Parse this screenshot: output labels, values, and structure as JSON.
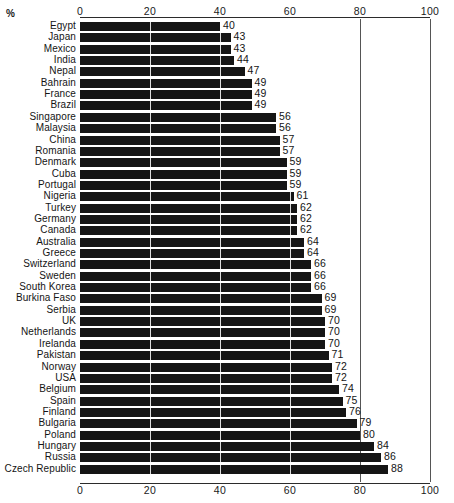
{
  "unit_label": "%",
  "chart_data": {
    "type": "bar",
    "orientation": "horizontal",
    "title": "",
    "subtitle": "",
    "xlabel": "",
    "ylabel": "",
    "unit": "%",
    "xlim": [
      0,
      100
    ],
    "xticks": [
      0,
      20,
      40,
      60,
      80,
      100
    ],
    "xtick_labels": [
      "0",
      "20",
      "40",
      "60",
      "80",
      "100"
    ],
    "grid": true,
    "grid_axis": "x",
    "axis_top": true,
    "axis_bottom": true,
    "legend": false,
    "data_labels": true,
    "bar_color": "#151515",
    "categories": [
      "Egypt",
      "Japan",
      "Mexico",
      "India",
      "Nepal",
      "Bahrain",
      "France",
      "Brazil",
      "Singapore",
      "Malaysia",
      "China",
      "Romania",
      "Denmark",
      "Cuba",
      "Portugal",
      "Nigeria",
      "Turkey",
      "Germany",
      "Canada",
      "Australia",
      "Greece",
      "Switzerland",
      "Sweden",
      "South Korea",
      "Burkina Faso",
      "Serbia",
      "UK",
      "Netherlands",
      "Irelanda",
      "Pakistan",
      "Norway",
      "USA",
      "Belgium",
      "Spain",
      "Finland",
      "Bulgaria",
      "Poland",
      "Hungary",
      "Russia",
      "Czech Republic"
    ],
    "values": [
      40,
      43,
      43,
      44,
      47,
      49,
      49,
      49,
      56,
      56,
      57,
      57,
      59,
      59,
      59,
      61,
      62,
      62,
      62,
      64,
      64,
      66,
      66,
      66,
      69,
      69,
      70,
      70,
      70,
      71,
      72,
      72,
      74,
      75,
      76,
      79,
      80,
      84,
      86,
      88
    ]
  }
}
